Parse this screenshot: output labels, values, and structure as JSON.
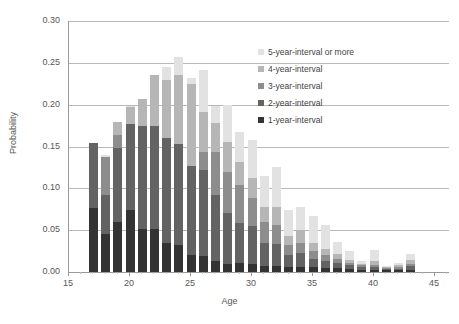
{
  "figure": {
    "top_caption_fragment": "",
    "bottom_caption_fragment": ""
  },
  "axis": {
    "y_title": "Probability",
    "x_title": "Age",
    "y_ticks": [
      "0.00",
      "0.05",
      "0.10",
      "0.15",
      "0.20",
      "0.25",
      "0.30"
    ],
    "x_ticks": [
      "15",
      "20",
      "25",
      "30",
      "35",
      "40",
      "45"
    ]
  },
  "legend": {
    "position": "inside-top-right",
    "entries": [
      {
        "label": "5-year-interval or more",
        "color": "#e2e2e2"
      },
      {
        "label": "4-year-interval",
        "color": "#b6b6b6"
      },
      {
        "label": "3-year-interval",
        "color": "#8d8d8d"
      },
      {
        "label": "2-year-interval",
        "color": "#636363"
      },
      {
        "label": "1-year-interval",
        "color": "#333333"
      }
    ]
  },
  "chart_data": {
    "type": "bar",
    "subtype": "stacked-vertical",
    "title": "",
    "xlabel": "Age",
    "ylabel": "Probability",
    "xlim": [
      15,
      48
    ],
    "ylim": [
      0.0,
      0.3
    ],
    "ytick_step": 0.05,
    "xtick_step": 5,
    "grid": "horizontal",
    "categories": [
      17,
      18,
      19,
      20,
      21,
      22,
      23,
      24,
      25,
      26,
      27,
      28,
      29,
      30,
      31,
      32,
      33,
      34,
      35,
      36,
      37,
      38,
      39,
      40,
      41,
      42,
      43
    ],
    "series": [
      {
        "name": "1-year-interval",
        "color": "#333333",
        "values": [
          0.077,
          0.046,
          0.06,
          0.074,
          0.052,
          0.051,
          0.035,
          0.032,
          0.02,
          0.019,
          0.013,
          0.009,
          0.011,
          0.009,
          0.007,
          0.007,
          0.006,
          0.006,
          0.006,
          0.005,
          0.005,
          0.004,
          0.003,
          0.003,
          0.002,
          0.002,
          0.003
        ]
      },
      {
        "name": "2-year-interval",
        "color": "#636363",
        "values": [
          0.077,
          0.046,
          0.088,
          0.103,
          0.122,
          0.124,
          0.125,
          0.121,
          0.107,
          0.103,
          0.079,
          0.062,
          0.048,
          0.046,
          0.028,
          0.027,
          0.014,
          0.017,
          0.01,
          0.008,
          0.006,
          0.004,
          0.003,
          0.003,
          0.002,
          0.002,
          0.004
        ]
      },
      {
        "name": "3-year-interval",
        "color": "#8d8d8d",
        "values": [
          0.0,
          0.046,
          0.016,
          0.0,
          0.0,
          0.0,
          0.0,
          0.0,
          0.0,
          0.022,
          0.051,
          0.048,
          0.045,
          0.034,
          0.025,
          0.022,
          0.012,
          0.012,
          0.009,
          0.007,
          0.005,
          0.003,
          0.002,
          0.003,
          0.001,
          0.002,
          0.003
        ]
      },
      {
        "name": "4-year-interval",
        "color": "#b6b6b6",
        "values": [
          0.0,
          0.0,
          0.015,
          0.02,
          0.033,
          0.06,
          0.07,
          0.082,
          0.098,
          0.047,
          0.035,
          0.037,
          0.027,
          0.023,
          0.018,
          0.022,
          0.011,
          0.015,
          0.01,
          0.008,
          0.005,
          0.003,
          0.002,
          0.004,
          0.001,
          0.002,
          0.004
        ]
      },
      {
        "name": "5-year-interval or more",
        "color": "#e2e2e2",
        "values": [
          0.0,
          0.002,
          0.0,
          0.001,
          0.0,
          0.0,
          0.015,
          0.022,
          0.007,
          0.051,
          0.021,
          0.044,
          0.036,
          0.046,
          0.037,
          0.048,
          0.031,
          0.028,
          0.032,
          0.028,
          0.015,
          0.011,
          0.003,
          0.013,
          0.001,
          0.003,
          0.008
        ]
      }
    ],
    "totals": [
      0.154,
      0.14,
      0.179,
      0.198,
      0.207,
      0.235,
      0.245,
      0.257,
      0.252,
      0.242,
      0.199,
      0.2,
      0.167,
      0.158,
      0.115,
      0.126,
      0.074,
      0.078,
      0.067,
      0.056,
      0.036,
      0.025,
      0.013,
      0.026,
      0.007,
      0.011,
      0.022
    ]
  }
}
